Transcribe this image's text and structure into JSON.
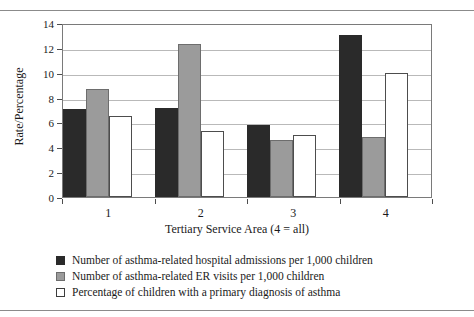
{
  "chart_data": {
    "type": "bar",
    "title": "",
    "xlabel": "Tertiary Service Area (4 = all)",
    "ylabel": "Rate/Percentage",
    "categories": [
      "1",
      "2",
      "3",
      "4"
    ],
    "ylim": [
      0,
      14
    ],
    "yticks": [
      "0",
      "2",
      "4",
      "6",
      "8",
      "10",
      "12",
      "14"
    ],
    "grid": true,
    "legend_position": "bottom-left",
    "series": [
      {
        "name": "Number of asthma-related hospital admissions per 1,000 children",
        "color": "#2a2a2a",
        "values": [
          7.1,
          7.2,
          5.8,
          13.0
        ]
      },
      {
        "name": "Number of asthma-related ER visits per 1,000 children",
        "color": "#9b9b9b",
        "values": [
          8.7,
          12.3,
          4.6,
          4.85
        ]
      },
      {
        "name": "Percentage of children with a primary diagnosis of asthma",
        "color": "#ffffff",
        "values": [
          6.5,
          5.3,
          5.0,
          9.95
        ]
      }
    ]
  },
  "legend": {
    "items": [
      {
        "label": "Number of asthma-related hospital admissions per 1,000 children",
        "swatch": "dark"
      },
      {
        "label": "Number of asthma-related ER visits per 1,000 children",
        "swatch": "gray"
      },
      {
        "label": "Percentage of children with a primary diagnosis of asthma",
        "swatch": "white"
      }
    ]
  }
}
